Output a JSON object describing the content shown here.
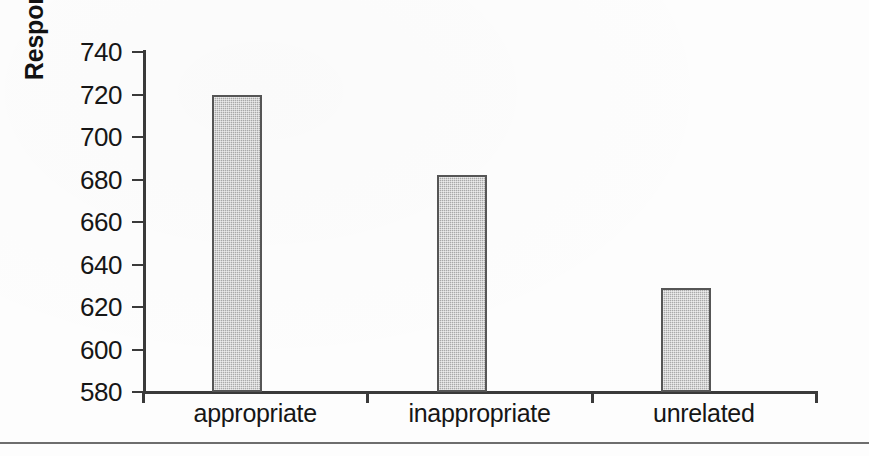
{
  "figure": {
    "background_color": "#fdfdfd",
    "axis_color": "#3a3a3a",
    "bar_fill_color": "#a9a9a9",
    "bar_border_color": "#565656",
    "text_color": "#161616",
    "separator_color": "#6e6e6e"
  },
  "chart_data": {
    "type": "bar",
    "title": "",
    "subtitle": "",
    "xlabel": "",
    "ylabel": "Response Latencies (msec)",
    "categories": [
      "appropriate",
      "inappropriate",
      "unrelated"
    ],
    "values": [
      720,
      682,
      629
    ],
    "series": [
      {
        "name": "Response Latency",
        "values": [
          720,
          682,
          629
        ]
      }
    ],
    "ylim": [
      580,
      740
    ],
    "yticks": [
      580,
      600,
      620,
      640,
      660,
      680,
      700,
      720,
      740
    ],
    "ytick_labels": [
      "580",
      "600",
      "620",
      "640",
      "660",
      "680",
      "700",
      "720",
      "740"
    ],
    "grid": false,
    "legend": false,
    "legend_position": "none",
    "annotations": []
  }
}
